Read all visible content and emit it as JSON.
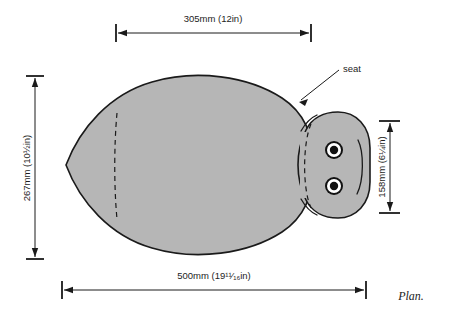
{
  "figure": {
    "caption": "Plan.",
    "callout": {
      "label": "seat",
      "icon": "leader-arrow-icon"
    }
  },
  "dimensions": {
    "top": {
      "name": "top-width-dimension",
      "metric": "305mm",
      "imperial": "(12in)",
      "full_label": "305mm (12in)"
    },
    "left": {
      "name": "left-height-dimension",
      "metric": "267mm",
      "imperial_whole": "(10",
      "imperial_num": "1",
      "imperial_den": "2",
      "imperial_suffix": "in)",
      "full_label": "267mm (10½in)"
    },
    "right": {
      "name": "right-height-dimension",
      "metric": "158mm",
      "imperial_whole": "(6",
      "imperial_num": "1",
      "imperial_den": "4",
      "imperial_suffix": "in)",
      "full_label": "158mm (6¼in)"
    },
    "bottom": {
      "name": "bottom-width-dimension",
      "metric": "500mm",
      "imperial_whole": "(19",
      "imperial_num": "11",
      "imperial_den": "16",
      "imperial_suffix": "in)",
      "full_label": "500mm (19¹¹⁄₁₆in)"
    }
  },
  "colors": {
    "fill": "#b6b6b6",
    "stroke": "#1a1a1a",
    "background": "#ffffff",
    "hole_ring": "#ffffff",
    "hole_center": "#111111"
  },
  "parts": {
    "body": "seat-body-outline",
    "head": "seat-head-lobe",
    "seam": "dashed-seam-line",
    "arc": "head-arc-line",
    "hole_upper": "mounting-hole-upper",
    "hole_lower": "mounting-hole-lower"
  }
}
